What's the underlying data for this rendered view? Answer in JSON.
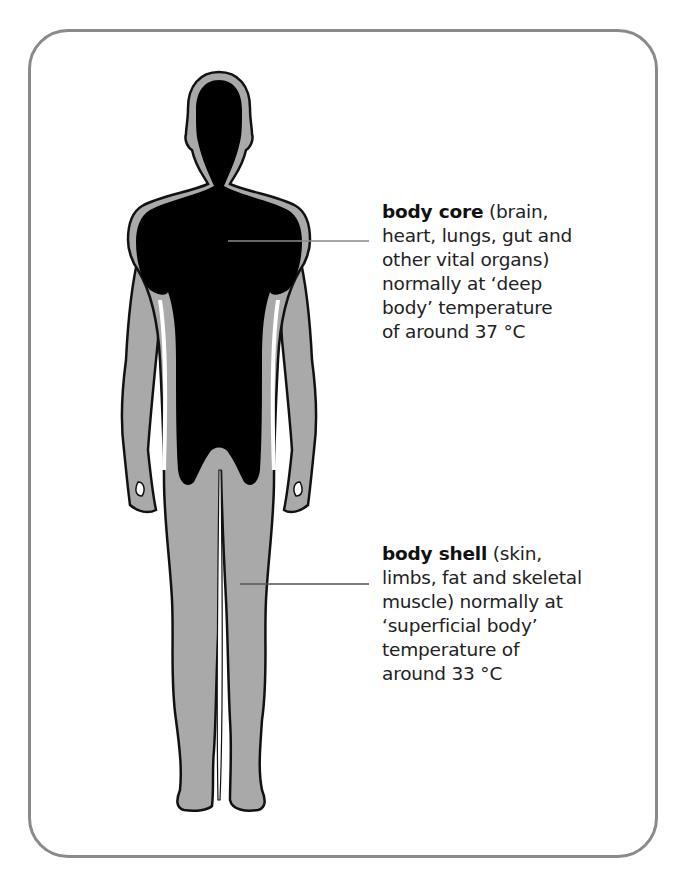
{
  "diagram": {
    "colors": {
      "frame": "#8a8a8a",
      "core": "#000000",
      "shell": "#a9a9a9",
      "outline": "#111111",
      "leader_line": "#8a8a8a",
      "text": "#222222"
    },
    "labels": {
      "core": {
        "term": "body core",
        "description": " (brain,\nheart, lungs, gut and\nother vital organs)\nnormally at ‘deep\nbody’ temperature\nof around 37 °C",
        "temperature": "37 °C"
      },
      "shell": {
        "term": "body shell",
        "description": " (skin,\nlimbs, fat and skeletal\nmuscle) normally at\n‘superficial body’\ntemperature of\naround 33 °C",
        "temperature": "33 °C"
      }
    }
  }
}
